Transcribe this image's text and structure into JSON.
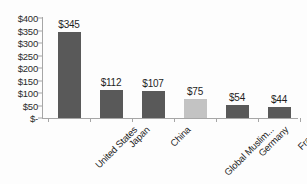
{
  "chart_data": {
    "type": "bar",
    "title": "",
    "xlabel": "",
    "ylabel": "",
    "categories": [
      "United States",
      "Japan",
      "China",
      "Global Muslim...",
      "Germany",
      "France"
    ],
    "values": [
      345,
      112,
      107,
      75,
      54,
      44
    ],
    "value_labels": [
      "$345",
      "$112",
      "$107",
      "$75",
      "$54",
      "$44"
    ],
    "bar_colors": [
      "#595959",
      "#595959",
      "#595959",
      "#c3c3c3",
      "#595959",
      "#595959"
    ],
    "highlight_index": 3,
    "ylim": [
      0,
      400
    ],
    "ytick_values": [
      400,
      350,
      300,
      250,
      200,
      150,
      100,
      50,
      0
    ],
    "ytick_labels": [
      "$400",
      "$350",
      "$300",
      "$250",
      "$200",
      "$150",
      "$100",
      "$50",
      "$-"
    ],
    "grid": false,
    "legend": false,
    "axis_color": "#a6a6a6",
    "text_color": "#1f1f1f"
  }
}
